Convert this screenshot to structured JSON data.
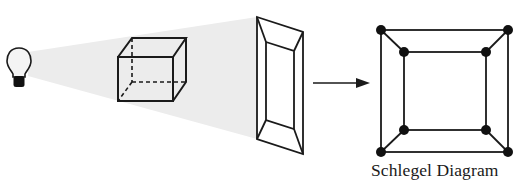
{
  "diagram": {
    "caption": "Schlegel Diagram",
    "colors": {
      "stroke": "#1a1a1a",
      "light_cone": "#ececec",
      "bulb_glass": "#f4f4f4",
      "bulb_base": "#111111",
      "background": "#ffffff"
    },
    "elements": [
      {
        "id": "light-bulb",
        "kind": "light-source"
      },
      {
        "id": "light-cone",
        "kind": "projection-rays"
      },
      {
        "id": "cube",
        "kind": "3d-wireframe-cube",
        "hidden_edges": "dashed"
      },
      {
        "id": "projection-screen",
        "kind": "projected-shadow"
      },
      {
        "id": "arrow",
        "kind": "transform-arrow"
      },
      {
        "id": "schlegel-graph",
        "kind": "graph",
        "vertices": 8,
        "edges": 12
      }
    ],
    "schlegel_graph": {
      "outer_square": [
        [
          381,
          30
        ],
        [
          508,
          30
        ],
        [
          508,
          152
        ],
        [
          381,
          152
        ]
      ],
      "inner_square": [
        [
          404,
          52
        ],
        [
          486,
          52
        ],
        [
          486,
          130
        ],
        [
          404,
          130
        ]
      ]
    }
  }
}
